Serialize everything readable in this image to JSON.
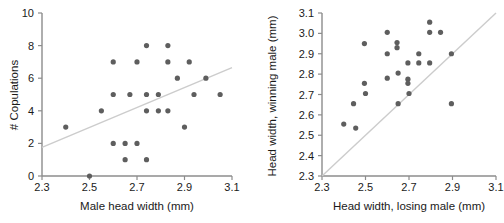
{
  "figure": {
    "background": "#ffffff",
    "point_color": "#5e5e5e",
    "axis_color": "#8c8c8c",
    "line_color": "#cccccc",
    "text_color": "#1a1a1a",
    "panel_count": 2
  },
  "chart_data": [
    {
      "type": "scatter",
      "panel": "left",
      "title": "",
      "xlabel": "Male head width (mm)",
      "ylabel": "# Copulations",
      "xlim": [
        2.3,
        3.1
      ],
      "ylim": [
        0,
        10
      ],
      "xticks": [
        2.3,
        2.5,
        2.7,
        2.9,
        3.1
      ],
      "xticklabels": [
        "2.3",
        "2.5",
        "2.7",
        "2.9",
        "3.1"
      ],
      "yticks": [
        0,
        2,
        4,
        6,
        8,
        10
      ],
      "yticklabels": [
        "0",
        "2",
        "4",
        "6",
        "8",
        "10"
      ],
      "grid": false,
      "legend": "none",
      "points": [
        [
          2.4,
          3
        ],
        [
          2.5,
          0
        ],
        [
          2.6,
          7
        ],
        [
          2.55,
          4
        ],
        [
          2.6,
          5
        ],
        [
          2.6,
          2
        ],
        [
          2.65,
          2
        ],
        [
          2.65,
          1
        ],
        [
          2.67,
          5
        ],
        [
          2.7,
          7
        ],
        [
          2.7,
          2
        ],
        [
          2.74,
          8
        ],
        [
          2.74,
          5
        ],
        [
          2.74,
          4
        ],
        [
          2.74,
          1
        ],
        [
          2.79,
          5
        ],
        [
          2.79,
          4
        ],
        [
          2.83,
          8
        ],
        [
          2.83,
          7
        ],
        [
          2.83,
          4
        ],
        [
          2.87,
          6
        ],
        [
          2.9,
          3
        ],
        [
          2.92,
          7
        ],
        [
          2.94,
          5
        ],
        [
          2.99,
          6
        ],
        [
          3.05,
          5
        ]
      ],
      "trendline": {
        "label": "regression line",
        "x": [
          2.3,
          3.1
        ],
        "y": [
          1.75,
          6.65
        ]
      }
    },
    {
      "type": "scatter",
      "panel": "right",
      "title": "",
      "xlabel": "Head width, losing male (mm)",
      "ylabel": "Head width, winning male (mm)",
      "xlim": [
        2.3,
        3.1
      ],
      "ylim": [
        2.3,
        3.1
      ],
      "xticks": [
        2.3,
        2.5,
        2.7,
        2.9,
        3.1
      ],
      "xticklabels": [
        "2.3",
        "2.5",
        "2.7",
        "2.9",
        "3.1"
      ],
      "yticks": [
        2.3,
        2.4,
        2.5,
        2.6,
        2.7,
        2.8,
        2.9,
        3.0,
        3.1
      ],
      "yticklabels": [
        "2.3",
        "2.4",
        "2.5",
        "2.6",
        "2.7",
        "2.8",
        "2.9",
        "3.0",
        "3.1"
      ],
      "grid": false,
      "legend": "none",
      "points": [
        [
          2.4,
          2.555
        ],
        [
          2.445,
          2.655
        ],
        [
          2.455,
          2.535
        ],
        [
          2.495,
          2.95
        ],
        [
          2.495,
          2.755
        ],
        [
          2.5,
          2.705
        ],
        [
          2.6,
          3.005
        ],
        [
          2.6,
          2.9
        ],
        [
          2.6,
          2.78
        ],
        [
          2.645,
          2.955
        ],
        [
          2.645,
          2.93
        ],
        [
          2.65,
          2.805
        ],
        [
          2.65,
          2.655
        ],
        [
          2.695,
          2.855
        ],
        [
          2.695,
          2.775
        ],
        [
          2.695,
          2.755
        ],
        [
          2.7,
          2.705
        ],
        [
          2.745,
          2.9
        ],
        [
          2.745,
          2.855
        ],
        [
          2.795,
          3.055
        ],
        [
          2.795,
          3.005
        ],
        [
          2.795,
          2.855
        ],
        [
          2.845,
          3.005
        ],
        [
          2.895,
          2.9
        ],
        [
          2.895,
          2.655
        ]
      ],
      "trendline": {
        "label": "y = x identity line",
        "x": [
          2.3,
          3.1
        ],
        "y": [
          2.3,
          3.1
        ]
      }
    }
  ]
}
